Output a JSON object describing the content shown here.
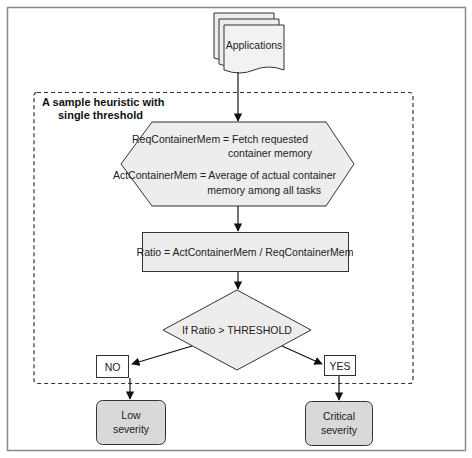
{
  "diagram": {
    "type": "flowchart",
    "colors": {
      "frame": "#808080",
      "stroke": "#333333",
      "node_fill": "#ededed",
      "terminal_fill": "#d9d9d9",
      "background": "#ffffff"
    },
    "source_node": {
      "label": "Applications"
    },
    "group": {
      "title_line1": "A sample heuristic with",
      "title_line2": "single threshold"
    },
    "prepare_node": {
      "line1": "ReqContainerMem = Fetch requested",
      "line2": "container memory",
      "line3": "ActContainerMem = Average of actual container",
      "line4": "memory among all tasks"
    },
    "process_node": {
      "label": "Ratio = ActContainerMem / ReqContainerMem"
    },
    "decision_node": {
      "label": "If Ratio > THRESHOLD"
    },
    "branches": {
      "no": {
        "label": "NO"
      },
      "yes": {
        "label": "YES"
      }
    },
    "outcomes": {
      "low": {
        "line1": "Low",
        "line2": "severity"
      },
      "critical": {
        "line1": "Critical",
        "line2": "severity"
      }
    }
  }
}
